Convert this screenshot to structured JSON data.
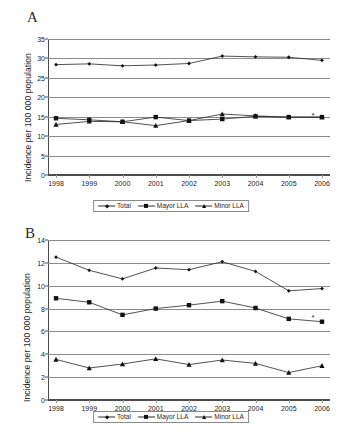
{
  "figure": {
    "panels": [
      {
        "letter": "A",
        "ylabel": "Incidence per 100 000 population",
        "legend": [
          "Total",
          "Mayor LLA",
          "Minor LLA"
        ]
      },
      {
        "letter": "B",
        "ylabel": "Incidence per 100 000 population",
        "legend": [
          "Total",
          "Mayor LLA",
          "Minor LLA"
        ]
      }
    ]
  },
  "chart_data": [
    {
      "type": "line",
      "panel": "A",
      "title": "",
      "xlabel": "",
      "ylabel": "Incidence per 100 000 population",
      "categories": [
        "1998",
        "1999",
        "2000",
        "2001",
        "2002",
        "2003",
        "2004",
        "2005",
        "2006"
      ],
      "xticklabels": [
        "1998",
        "1999",
        "2000",
        "2001",
        "2002",
        "2003",
        "2004",
        "2005",
        "2006"
      ],
      "yticklabels": [
        "0",
        "5",
        "10",
        "15",
        "20",
        "25",
        "30",
        "35"
      ],
      "yticks": [
        0,
        5,
        10,
        15,
        20,
        25,
        30,
        35
      ],
      "ylim": [
        0,
        35
      ],
      "grid": true,
      "legend_position": "bottom",
      "series": [
        {
          "name": "Total",
          "marker": "diamond",
          "values": [
            28.4,
            28.6,
            28.1,
            28.3,
            28.7,
            30.6,
            30.4,
            30.3,
            29.5
          ]
        },
        {
          "name": "Mayor LLA",
          "marker": "square",
          "values": [
            14.6,
            14.2,
            13.7,
            14.9,
            14.0,
            14.4,
            15.1,
            14.9,
            14.9
          ]
        },
        {
          "name": "Minor LLA",
          "marker": "triangle",
          "values": [
            13.0,
            13.8,
            13.7,
            12.7,
            14.0,
            15.7,
            15.2,
            14.9,
            14.9
          ]
        }
      ],
      "annotations": [
        {
          "text": "*",
          "series": "Mayor LLA",
          "x": "2006",
          "y": 15.0
        }
      ]
    },
    {
      "type": "line",
      "panel": "B",
      "title": "",
      "xlabel": "",
      "ylabel": "Incidence per 100 000 population",
      "categories": [
        "1998",
        "1999",
        "2000",
        "2001",
        "2002",
        "2003",
        "2004",
        "2005",
        "2006"
      ],
      "xticklabels": [
        "1998",
        "1999",
        "2000",
        "2001",
        "2002",
        "2003",
        "2004",
        "2005",
        "2006"
      ],
      "yticklabels": [
        "0",
        "2",
        "4",
        "6",
        "8",
        "10",
        "12",
        "14"
      ],
      "yticks": [
        0,
        2,
        4,
        6,
        8,
        10,
        12,
        14
      ],
      "ylim": [
        0,
        14
      ],
      "grid": true,
      "legend_position": "bottom",
      "series": [
        {
          "name": "Total",
          "marker": "diamond",
          "values": [
            12.5,
            11.35,
            10.6,
            11.55,
            11.4,
            12.1,
            11.25,
            9.55,
            9.75
          ]
        },
        {
          "name": "Mayor LLA",
          "marker": "square",
          "values": [
            8.9,
            8.55,
            7.45,
            8.0,
            8.3,
            8.65,
            8.05,
            7.1,
            6.85
          ]
        },
        {
          "name": "Minor LLA",
          "marker": "triangle",
          "values": [
            3.55,
            2.8,
            3.15,
            3.6,
            3.1,
            3.5,
            3.2,
            2.4,
            3.0
          ]
        }
      ],
      "annotations": [
        {
          "text": "*",
          "series": "Mayor LLA",
          "x": "2006",
          "y": 7.05
        }
      ]
    }
  ]
}
